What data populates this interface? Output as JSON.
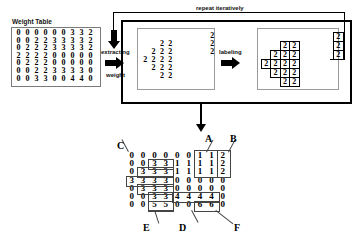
{
  "figure": {
    "title_weight_table": "Weight Table",
    "captions": {
      "extracting": "extracting",
      "weight": "weight",
      "labeling": "labeling",
      "repeat": "repeat iteratively"
    }
  },
  "weight_table": {
    "rows": 7,
    "cols": 9,
    "values": [
      [
        0,
        0,
        0,
        0,
        0,
        0,
        3,
        3,
        2
      ],
      [
        0,
        0,
        2,
        2,
        3,
        3,
        3,
        3,
        2
      ],
      [
        0,
        2,
        2,
        2,
        3,
        3,
        3,
        3,
        2
      ],
      [
        2,
        2,
        2,
        2,
        0,
        0,
        0,
        0,
        0
      ],
      [
        0,
        2,
        2,
        2,
        0,
        0,
        0,
        0,
        0
      ],
      [
        0,
        0,
        2,
        2,
        3,
        3,
        3,
        3,
        0
      ],
      [
        0,
        0,
        3,
        3,
        0,
        0,
        4,
        4,
        0
      ]
    ]
  },
  "extracted": {
    "label": "extracted-weight-2",
    "rows": 7,
    "cols": 9,
    "value": "2",
    "mask": [
      [
        0,
        0,
        0,
        0,
        0,
        0,
        0,
        0,
        1
      ],
      [
        0,
        0,
        1,
        1,
        0,
        0,
        0,
        0,
        1
      ],
      [
        0,
        1,
        1,
        1,
        0,
        0,
        0,
        0,
        1
      ],
      [
        1,
        1,
        1,
        1,
        0,
        0,
        0,
        0,
        0
      ],
      [
        0,
        1,
        1,
        1,
        0,
        0,
        0,
        0,
        0
      ],
      [
        0,
        0,
        1,
        1,
        0,
        0,
        0,
        0,
        0
      ],
      [
        0,
        0,
        0,
        0,
        0,
        0,
        0,
        0,
        0
      ]
    ]
  },
  "labeled": {
    "label": "labeled-components",
    "rows": 7,
    "cols": 9,
    "value": "2",
    "mask": [
      [
        0,
        0,
        0,
        0,
        0,
        0,
        0,
        0,
        1
      ],
      [
        0,
        0,
        1,
        1,
        0,
        0,
        0,
        0,
        1
      ],
      [
        0,
        1,
        1,
        1,
        0,
        0,
        0,
        0,
        1
      ],
      [
        1,
        1,
        1,
        1,
        0,
        0,
        0,
        0,
        0
      ],
      [
        0,
        1,
        1,
        1,
        0,
        0,
        0,
        0,
        0
      ],
      [
        0,
        0,
        1,
        1,
        0,
        0,
        0,
        0,
        0
      ],
      [
        0,
        0,
        0,
        0,
        0,
        0,
        0,
        0,
        0
      ]
    ]
  },
  "result_table": {
    "rows": 7,
    "cols": 9,
    "values": [
      [
        0,
        0,
        0,
        0,
        0,
        0,
        1,
        1,
        2
      ],
      [
        0,
        0,
        3,
        3,
        1,
        1,
        1,
        1,
        2
      ],
      [
        0,
        3,
        3,
        3,
        1,
        1,
        1,
        1,
        2
      ],
      [
        3,
        3,
        3,
        3,
        0,
        0,
        0,
        0,
        0
      ],
      [
        0,
        3,
        3,
        3,
        0,
        0,
        0,
        0,
        0
      ],
      [
        0,
        0,
        3,
        3,
        4,
        4,
        4,
        4,
        0
      ],
      [
        0,
        0,
        5,
        5,
        0,
        0,
        6,
        6,
        0
      ]
    ],
    "callouts": [
      {
        "name": "callout-a",
        "text": "A"
      },
      {
        "name": "callout-b",
        "text": "B"
      },
      {
        "name": "callout-c",
        "text": "C"
      },
      {
        "name": "callout-d",
        "text": "D"
      },
      {
        "name": "callout-e",
        "text": "E"
      },
      {
        "name": "callout-f",
        "text": "F"
      }
    ]
  }
}
